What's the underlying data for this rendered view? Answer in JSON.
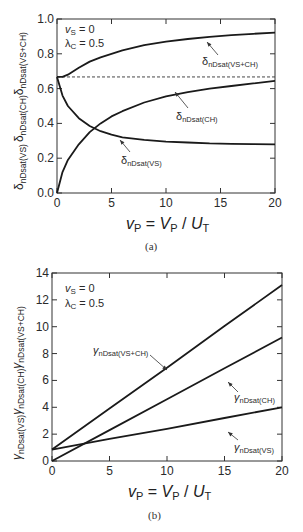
{
  "chart_data": [
    {
      "type": "line",
      "panel": "(a)",
      "caption": "(a)",
      "xlabel": "v_P = V_P / U_T",
      "ylabel": "δnDsat(VS)  δnDsat(CH)  δnDsat(VS+CH)",
      "xlim": [
        0,
        20
      ],
      "ylim": [
        0.0,
        1.0
      ],
      "xticks": [
        "0",
        "5",
        "10",
        "15",
        "20"
      ],
      "yticks": [
        "0.0",
        "0.2",
        "0.4",
        "0.6",
        "0.8",
        "1.0"
      ],
      "grid": false,
      "annotations": [
        "vS = 0",
        "λC = 0.5"
      ],
      "reference_line": {
        "style": "dashed",
        "y": 0.667
      },
      "x": [
        0,
        0.5,
        1,
        2,
        3,
        4,
        5,
        6,
        8,
        10,
        12,
        14,
        16,
        18,
        20
      ],
      "series": [
        {
          "name": "δnDsat(VS+CH)",
          "values": [
            0.667,
            0.667,
            0.68,
            0.72,
            0.755,
            0.78,
            0.8,
            0.82,
            0.85,
            0.87,
            0.885,
            0.897,
            0.907,
            0.915,
            0.922
          ]
        },
        {
          "name": "δnDsat(CH)",
          "values": [
            0.0,
            0.12,
            0.19,
            0.28,
            0.35,
            0.4,
            0.44,
            0.47,
            0.52,
            0.555,
            0.58,
            0.6,
            0.615,
            0.63,
            0.645
          ]
        },
        {
          "name": "δnDsat(VS)",
          "values": [
            0.667,
            0.56,
            0.5,
            0.43,
            0.385,
            0.355,
            0.335,
            0.32,
            0.305,
            0.295,
            0.29,
            0.285,
            0.283,
            0.281,
            0.28
          ]
        }
      ]
    },
    {
      "type": "line",
      "panel": "(b)",
      "caption": "(b)",
      "xlabel": "v_P = V_P / U_T",
      "ylabel": "γnDsat(VS)  γnDsat(CH)  γnDsat(VS+CH)",
      "xlim": [
        0,
        20
      ],
      "ylim": [
        0,
        14
      ],
      "xticks": [
        "0",
        "5",
        "10",
        "15",
        "20"
      ],
      "yticks": [
        "0",
        "2",
        "4",
        "6",
        "8",
        "10",
        "12",
        "14"
      ],
      "grid": false,
      "annotations": [
        "vS = 0",
        "λC = 0.5"
      ],
      "x": [
        0,
        5,
        10,
        15,
        20
      ],
      "series": [
        {
          "name": "γnDsat(VS+CH)",
          "values": [
            0.85,
            3.9,
            6.95,
            10.05,
            13.1
          ]
        },
        {
          "name": "γnDsat(CH)",
          "values": [
            0.0,
            2.3,
            4.6,
            6.9,
            9.2
          ]
        },
        {
          "name": "γnDsat(VS)",
          "values": [
            0.85,
            1.65,
            2.4,
            3.2,
            4.0
          ]
        }
      ]
    }
  ],
  "labels": {
    "a": {
      "vs": "v",
      "vs_sub": "S",
      "vs_val": " = 0",
      "lc": "λ",
      "lc_sub": "C",
      "lc_val": " = 0.5",
      "curve_top": "δ",
      "curve_top_sub": "nDsat(VS+CH)",
      "curve_ch": "δ",
      "curve_ch_sub": "nDsat(CH)",
      "curve_vs": "δ",
      "curve_vs_sub": "nDsat(VS)",
      "y1": "δ",
      "y1s": "nDsat(VS)",
      "y2": "δ",
      "y2s": "nDsat(CH)",
      "y3": "δ",
      "y3s": "nDsat(VS+CH)",
      "xl_v": "v",
      "xl_vs": "P",
      "xl_eq": " = ",
      "xl_V": "V",
      "xl_Vs": "P",
      "xl_sl": " / ",
      "xl_U": "U",
      "xl_Us": "T",
      "caption": "(a)"
    },
    "b": {
      "vs": "v",
      "vs_sub": "S",
      "vs_val": " = 0",
      "lc": "λ",
      "lc_sub": "C",
      "lc_val": " = 0.5",
      "curve_top": "γ",
      "curve_top_sub": "nDsat(VS+CH)",
      "curve_ch": "γ",
      "curve_ch_sub": "nDsat(CH)",
      "curve_vs": "γ",
      "curve_vs_sub": "nDsat(VS)",
      "y1": "γ",
      "y1s": "nDsat(VS)",
      "y2": "γ",
      "y2s": "nDsat(CH)",
      "y3": "γ",
      "y3s": "nDsat(VS+CH)",
      "xl_v": "v",
      "xl_vs": "P",
      "xl_eq": " = ",
      "xl_V": "V",
      "xl_Vs": "P",
      "xl_sl": " / ",
      "xl_U": "U",
      "xl_Us": "T",
      "caption": "(b)"
    }
  },
  "colors": {
    "line": "#1a1a1a",
    "frame": "#333333",
    "text": "#222222"
  }
}
